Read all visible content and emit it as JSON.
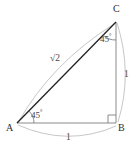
{
  "figure": {
    "type": "right-isosceles-triangle-diagram",
    "canvas": {
      "width": 137,
      "height": 152
    },
    "background_color": "#ffffff"
  },
  "vertices": [
    {
      "name": "A",
      "label": "A",
      "x": 17,
      "y": 123
    },
    {
      "name": "B",
      "label": "B",
      "x": 116,
      "y": 123
    },
    {
      "name": "C",
      "label": "C",
      "x": 116,
      "y": 22
    }
  ],
  "sides": [
    {
      "name": "hypotenuse-AC",
      "from": "A",
      "to": "C",
      "label": "2",
      "label_prefix": "√",
      "color": "#222222",
      "stroke_width": 1.2
    },
    {
      "name": "side-BC",
      "from": "B",
      "to": "C",
      "label": "1",
      "color": "#808080",
      "stroke_width": 1.0
    },
    {
      "name": "side-AB",
      "from": "A",
      "to": "B",
      "label": "1",
      "color": "#808080",
      "stroke_width": 1.0
    }
  ],
  "angles": [
    {
      "name": "angle-at-A",
      "vertex": "A",
      "value": "45",
      "degree_symbol": "°"
    },
    {
      "name": "angle-at-C",
      "vertex": "C",
      "value": "45",
      "degree_symbol": "°"
    },
    {
      "name": "angle-at-B",
      "vertex": "B",
      "value": "90",
      "marker": "right-angle-square"
    }
  ],
  "labels": {
    "vertex_a": "A",
    "vertex_b": "B",
    "vertex_c": "C",
    "angle_a": "45",
    "angle_c": "45",
    "degree": "°",
    "radical_sign": "√",
    "hypotenuse_value": "2",
    "side_bc_value": "1",
    "side_ab_value": "1"
  },
  "colors": {
    "hypotenuse": "#222222",
    "legs": "#808080",
    "arcs": "#b4b4b4",
    "angle_arcs": "#707070",
    "text": "#3a3a3a",
    "background": "#ffffff"
  }
}
